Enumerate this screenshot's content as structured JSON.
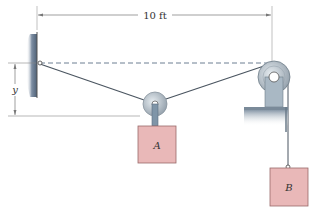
{
  "diagram": {
    "dimension_horizontal": {
      "label": "10 ft"
    },
    "dimension_vertical": {
      "label": "y"
    },
    "block_a": {
      "label": "A"
    },
    "block_b": {
      "label": "B"
    },
    "colors": {
      "block_fill": "#e9b8b8",
      "block_stroke": "#9a6a6a",
      "pulley_fill": "#c8d2da",
      "wall_fill": "#5f7389",
      "cable": "#4a5560",
      "dim_line": "#777777"
    }
  }
}
